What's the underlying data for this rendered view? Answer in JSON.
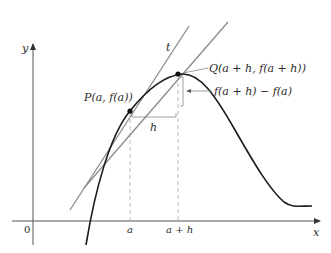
{
  "diagram": {
    "type": "secant-tangent-derivative",
    "axes": {
      "x_label": "x",
      "y_label": "y",
      "origin_label": "0",
      "x_ticks": [
        "a",
        "a + h"
      ]
    },
    "points": {
      "P": {
        "label": "P(a, f(a))"
      },
      "Q": {
        "label": "Q(a + h, f(a + h))"
      }
    },
    "lines": {
      "tangent_label": "t"
    },
    "annotations": {
      "h_label": "h",
      "rise_label": "f(a + h) − f(a)"
    },
    "colors": {
      "curve": "#1a1a1a",
      "tangent": "#8a8a8a",
      "secant": "#8a8a8a",
      "axes": "#555555",
      "dashed": "#aaaaaa",
      "text": "#2a2a2a"
    }
  }
}
